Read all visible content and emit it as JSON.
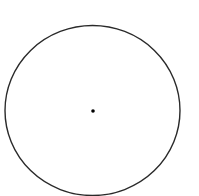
{
  "canvas": {
    "width": 199,
    "height": 196,
    "background": "#ffffff"
  },
  "diagram": {
    "type": "circle-with-center-point",
    "circle": {
      "cx": 92.5,
      "cy": 110.5,
      "rx": 87.5,
      "ry": 85,
      "stroke": "#2a2a2a",
      "stroke_width": 1.4,
      "fill": "none"
    },
    "center_point": {
      "cx": 93,
      "cy": 111,
      "r": 1.8,
      "fill": "#000000"
    }
  }
}
